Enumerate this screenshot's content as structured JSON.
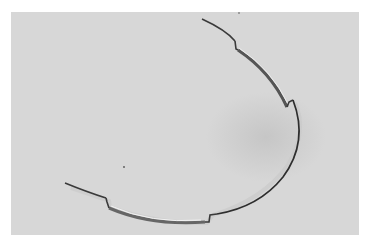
{
  "image": {
    "description": "Black-and-white photograph of a curved metal wire with stepped bends resting on a light gray surface",
    "background_color": "#d7d7d7",
    "page_color": "#ffffff",
    "wire_color": "#3a3a3a",
    "highlight_color": "#f2f2f2"
  }
}
